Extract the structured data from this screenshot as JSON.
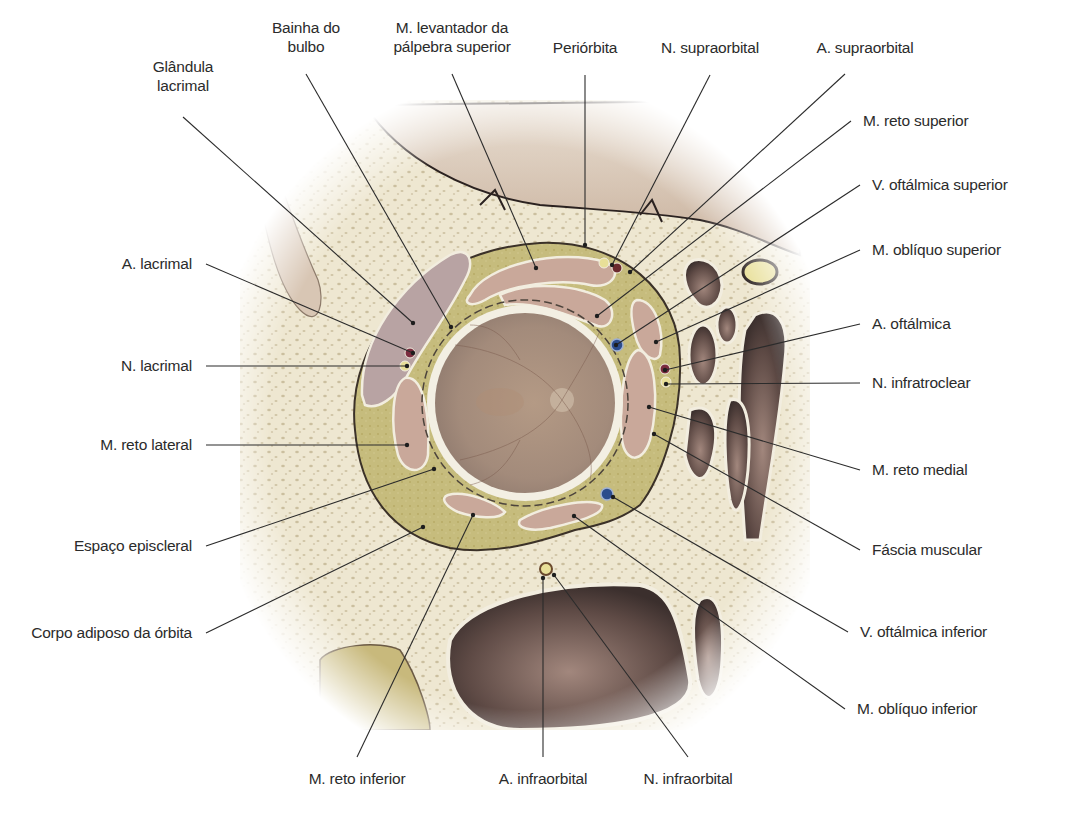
{
  "figure": {
    "colors": {
      "bone": "#efe9d3",
      "bone_spots": "#c9bc9c",
      "fat": "#c7bd7c",
      "muscle": "#c9a89a",
      "eye_fundus": "#a78f80",
      "sclera": "#f3efe3",
      "sinus_dark": "#6b5650",
      "artery": "#7a2b2e",
      "vein": "#2c4c8c",
      "nerve": "#e9df8a",
      "leader_line": "#2b2b2b"
    }
  },
  "labels": {
    "top": [
      {
        "id": "glandula-lacrimal",
        "text": "Glândula\nlacrimal",
        "x": 183,
        "y": 67,
        "anchor": [
          413,
          323
        ]
      },
      {
        "id": "bainha-do-bulbo",
        "text": "Bainha do\nbulbo",
        "x": 306,
        "y": 28,
        "anchor": [
          451,
          327
        ]
      },
      {
        "id": "m-levantador",
        "text": "M. levantador da\npálpebra superior",
        "x": 452,
        "y": 28,
        "anchor": [
          536,
          268
        ]
      },
      {
        "id": "periorbita",
        "text": "Periórbita",
        "x": 585,
        "y": 48,
        "anchor": [
          585,
          245
        ]
      },
      {
        "id": "n-supraorbital",
        "text": "N. supraorbital",
        "x": 710,
        "y": 48,
        "anchor": [
          612,
          265
        ]
      },
      {
        "id": "a-supraorbital",
        "text": "A. supraorbital",
        "x": 865,
        "y": 48,
        "anchor": [
          630,
          272
        ]
      }
    ],
    "right": [
      {
        "id": "m-reto-superior",
        "text": "M. reto superior",
        "x": 863,
        "y": 121,
        "anchor": [
          597,
          316
        ]
      },
      {
        "id": "v-oftalmica-superior",
        "text": "V. oftálmica superior",
        "x": 872,
        "y": 185,
        "anchor": [
          616,
          345
        ]
      },
      {
        "id": "m-obliquo-superior",
        "text": "M. oblíquo superior",
        "x": 872,
        "y": 250,
        "anchor": [
          656,
          342
        ]
      },
      {
        "id": "a-oftalmica",
        "text": "A. oftálmica",
        "x": 872,
        "y": 324,
        "anchor": [
          665,
          370
        ]
      },
      {
        "id": "n-infratroclear",
        "text": "N. infratroclear",
        "x": 872,
        "y": 383,
        "anchor": [
          666,
          384
        ]
      },
      {
        "id": "m-reto-medial",
        "text": "M. reto medial",
        "x": 872,
        "y": 470,
        "anchor": [
          649,
          407
        ]
      },
      {
        "id": "fascia-muscular",
        "text": "Fáscia muscular",
        "x": 872,
        "y": 550,
        "anchor": [
          654,
          434
        ]
      },
      {
        "id": "v-oftalmica-inferior",
        "text": "V. oftálmica inferior",
        "x": 860,
        "y": 632,
        "anchor": [
          613,
          497
        ]
      },
      {
        "id": "m-obliquo-inferior",
        "text": "M. oblíquo inferior",
        "x": 857,
        "y": 709,
        "anchor": [
          574,
          516
        ]
      }
    ],
    "left": [
      {
        "id": "a-lacrimal",
        "text": "A. lacrimal",
        "x": 192,
        "y": 264,
        "anchor": [
          413,
          353
        ]
      },
      {
        "id": "n-lacrimal",
        "text": "N. lacrimal",
        "x": 192,
        "y": 366,
        "anchor": [
          407,
          366
        ]
      },
      {
        "id": "m-reto-lateral",
        "text": "M. reto lateral",
        "x": 192,
        "y": 445,
        "anchor": [
          407,
          445
        ]
      },
      {
        "id": "espaco-episcleral",
        "text": "Espaço episcleral",
        "x": 192,
        "y": 546,
        "anchor": [
          434,
          469
        ]
      },
      {
        "id": "corpo-adiposo",
        "text": "Corpo adiposo da órbita",
        "x": 192,
        "y": 633,
        "anchor": [
          423,
          527
        ]
      }
    ],
    "bottom": [
      {
        "id": "m-reto-inferior",
        "text": "M. reto inferior",
        "x": 357,
        "y": 779,
        "anchor": [
          473,
          515
        ]
      },
      {
        "id": "a-infraorbital",
        "text": "A. infraorbital",
        "x": 543,
        "y": 779,
        "anchor": [
          543,
          578
        ]
      },
      {
        "id": "n-infraorbital",
        "text": "N. infraorbital",
        "x": 688,
        "y": 779,
        "anchor": [
          554,
          575
        ]
      }
    ]
  }
}
